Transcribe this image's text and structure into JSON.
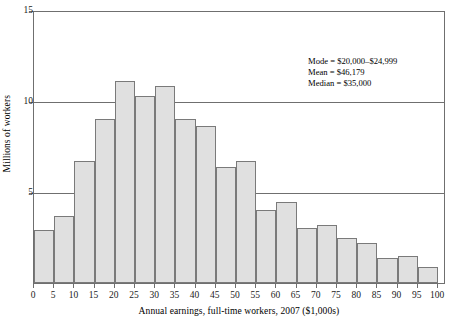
{
  "chart_data": {
    "type": "bar",
    "title": "",
    "subtitle": "",
    "xlabel": "Annual earnings, full-time workers, 2007 ($1,000s)",
    "ylabel": "Millions of workers",
    "xlim": [
      0,
      100
    ],
    "ylim": [
      0,
      15
    ],
    "grid": "horizontal gridlines at y = 5, 10, 15",
    "legend": "none",
    "bin_width": 5,
    "x_tick_labels": [
      "0",
      "5",
      "10",
      "15",
      "20",
      "25",
      "30",
      "35",
      "40",
      "45",
      "50",
      "55",
      "60",
      "65",
      "70",
      "75",
      "80",
      "85",
      "90",
      "95",
      "100"
    ],
    "y_tick_labels": [
      "5",
      "10",
      "15"
    ],
    "categories": [
      "0-5",
      "5-10",
      "10-15",
      "15-20",
      "20-25",
      "25-30",
      "30-35",
      "35-40",
      "40-45",
      "45-50",
      "50-55",
      "55-60",
      "60-65",
      "65-70",
      "70-75",
      "75-80",
      "80-85",
      "85-90",
      "90-95",
      "95-100"
    ],
    "values": [
      2.9,
      3.7,
      6.7,
      9.0,
      11.1,
      10.25,
      10.8,
      9.0,
      8.6,
      6.4,
      6.7,
      4.0,
      4.45,
      3.0,
      3.2,
      2.5,
      2.2,
      1.4,
      1.5,
      0.9
    ],
    "bar_fill_color": "#e0e0e0",
    "bar_edge_color": "#7a7a7a",
    "axis_color": "#6f6f6f",
    "annotations": [
      "Mode = $20,000–$24,999",
      "Mean = $46,179",
      "Median = $35,000"
    ]
  },
  "annotation_box": {
    "mode_line": "Mode = $20,000–$24,999",
    "mean_line": "Mean = $46,179",
    "median_line": "Median = $35,000"
  }
}
